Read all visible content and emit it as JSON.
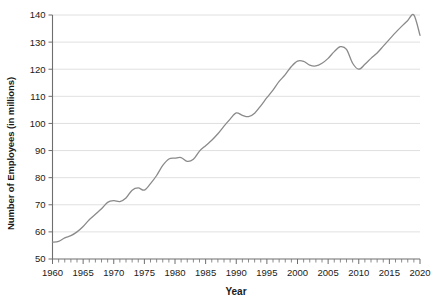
{
  "chart_data": {
    "type": "line",
    "title": "",
    "xlabel": "Year",
    "ylabel": "Number of Employees (in millions)",
    "xlim": [
      1960,
      2020
    ],
    "ylim": [
      50,
      140
    ],
    "yticks": [
      50,
      60,
      70,
      80,
      90,
      100,
      110,
      120,
      130,
      140
    ],
    "xticks": [
      1960,
      1965,
      1970,
      1975,
      1980,
      1985,
      1990,
      1995,
      2000,
      2005,
      2010,
      2015,
      2020
    ],
    "x_minor_tick_step": 1,
    "grid": "horizontal",
    "legend": "none",
    "line_color": "#8a8a8a",
    "grid_color": "#d8d8d8",
    "axis_color": "#6e6e6e",
    "x": [
      1960,
      1961,
      1962,
      1963,
      1964,
      1965,
      1966,
      1967,
      1968,
      1969,
      1970,
      1971,
      1972,
      1973,
      1974,
      1975,
      1976,
      1977,
      1978,
      1979,
      1980,
      1981,
      1982,
      1983,
      1984,
      1985,
      1986,
      1987,
      1988,
      1989,
      1990,
      1991,
      1992,
      1993,
      1994,
      1995,
      1996,
      1997,
      1998,
      1999,
      2000,
      2001,
      2002,
      2003,
      2004,
      2005,
      2006,
      2007,
      2008,
      2009,
      2010,
      2011,
      2012,
      2013,
      2014,
      2015,
      2016,
      2017,
      2018,
      2019,
      2020
    ],
    "values": [
      56.2,
      56.5,
      57.8,
      58.6,
      60.0,
      62.0,
      64.5,
      66.5,
      68.5,
      70.9,
      71.5,
      71.2,
      72.5,
      75.4,
      76.2,
      75.4,
      77.8,
      80.8,
      84.5,
      86.9,
      87.2,
      87.4,
      86.0,
      86.8,
      89.8,
      91.8,
      93.8,
      96.2,
      99.0,
      101.6,
      103.9,
      103.0,
      102.5,
      103.8,
      106.5,
      109.5,
      112.3,
      115.5,
      118.0,
      121.0,
      123.0,
      122.9,
      121.5,
      121.2,
      122.2,
      124.0,
      126.5,
      128.3,
      127.3,
      122.2,
      120.0,
      121.8,
      124.0,
      126.0,
      128.5,
      131.0,
      133.5,
      135.8,
      138.0,
      140.0,
      132.5
    ]
  },
  "axis": {
    "ytick_labels": [
      "50",
      "60",
      "70",
      "80",
      "90",
      "100",
      "110",
      "120",
      "130",
      "140"
    ],
    "xtick_labels": [
      "1960",
      "1965",
      "1970",
      "1975",
      "1980",
      "1985",
      "1990",
      "1995",
      "2000",
      "2005",
      "2010",
      "2015",
      "2020"
    ]
  }
}
